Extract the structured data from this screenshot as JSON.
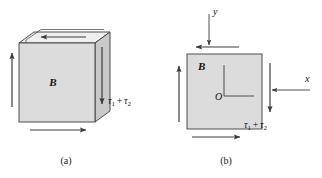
{
  "figure": {
    "background_color": "#ffffff",
    "line_color": "#3c3c3c",
    "face_fill_front": "#dcdcdc",
    "face_fill_top": "#efefef",
    "face_fill_side": "#c9c9c9",
    "square_fill": "#dcdcdc"
  },
  "panel_a": {
    "caption": "(a)",
    "body_label": "B",
    "stress_label": {
      "tau": "τ",
      "sub1": "1",
      "plus": "+",
      "sub2": "2",
      "full": "τ1 + τ2"
    },
    "arrows": [
      {
        "name": "top-face-arrow",
        "direction": "left"
      },
      {
        "name": "right-face-arrow",
        "direction": "down"
      },
      {
        "name": "left-edge-arrow",
        "direction": "up"
      },
      {
        "name": "bottom-edge-arrow",
        "direction": "right"
      }
    ]
  },
  "panel_b": {
    "caption": "(b)",
    "body_label": "B",
    "origin_label": "O",
    "axis_x_label": "x",
    "axis_y_label": "y",
    "stress_label": {
      "tau": "τ",
      "sub1": "1",
      "plus": "+",
      "sub2": "2",
      "full": "τ1 + τ2"
    },
    "arrows": [
      {
        "name": "top-arrow",
        "direction": "left"
      },
      {
        "name": "right-arrow",
        "direction": "down"
      },
      {
        "name": "left-arrow",
        "direction": "up"
      },
      {
        "name": "bottom-arrow",
        "direction": "right"
      },
      {
        "name": "y-axis-arrow",
        "direction": "down"
      },
      {
        "name": "x-axis-arrow",
        "direction": "left"
      }
    ]
  }
}
